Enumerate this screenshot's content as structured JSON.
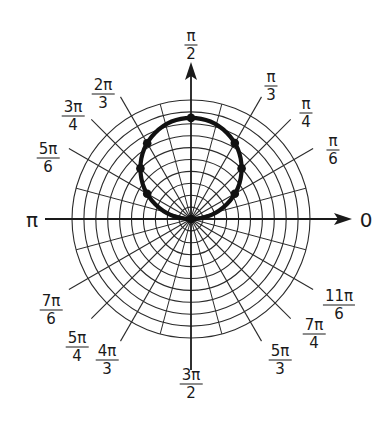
{
  "chart_data": {
    "type": "polar",
    "title": "",
    "curve": {
      "description": "circle r = a·sin(θ), passing through the pole, tangent to polar axis",
      "equation": "r = a sin θ",
      "a_grid_units": 8.5,
      "color": "#111111",
      "points": [
        {
          "theta": "0",
          "theta_rad": 0,
          "r": 0
        },
        {
          "theta": "π/6",
          "theta_rad": 0.5236,
          "r": 4.25
        },
        {
          "theta": "π/4",
          "theta_rad": 0.7854,
          "r": 6.01
        },
        {
          "theta": "π/3",
          "theta_rad": 1.0472,
          "r": 7.36
        },
        {
          "theta": "π/2",
          "theta_rad": 1.5708,
          "r": 8.5
        },
        {
          "theta": "2π/3",
          "theta_rad": 2.0944,
          "r": 7.36
        },
        {
          "theta": "3π/4",
          "theta_rad": 2.3562,
          "r": 6.01
        },
        {
          "theta": "5π/6",
          "theta_rad": 2.618,
          "r": 4.25
        },
        {
          "theta": "π",
          "theta_rad": 3.1416,
          "r": 0
        }
      ]
    },
    "grid": {
      "concentric_circles": 10,
      "radial_spokes_deg": [
        0,
        30,
        45,
        60,
        90,
        120,
        135,
        150,
        180,
        210,
        225,
        240,
        270,
        300,
        315,
        330
      ],
      "grid_on": true
    },
    "axes": {
      "horizontal_arrow_label": "0",
      "horizontal_left_label": "π",
      "vertical_arrow_label": "π/2"
    },
    "angle_labels": [
      {
        "id": "0",
        "num": "0",
        "den": ""
      },
      {
        "id": "pi6",
        "num": "π",
        "den": "6"
      },
      {
        "id": "pi4",
        "num": "π",
        "den": "4"
      },
      {
        "id": "pi3",
        "num": "π",
        "den": "3"
      },
      {
        "id": "pi2",
        "num": "π",
        "den": "2"
      },
      {
        "id": "2pi3",
        "num": "2π",
        "den": "3"
      },
      {
        "id": "3pi4",
        "num": "3π",
        "den": "4"
      },
      {
        "id": "5pi6",
        "num": "5π",
        "den": "6"
      },
      {
        "id": "pi",
        "num": "π",
        "den": ""
      },
      {
        "id": "7pi6",
        "num": "7π",
        "den": "6"
      },
      {
        "id": "5pi4",
        "num": "5π",
        "den": "4"
      },
      {
        "id": "4pi3",
        "num": "4π",
        "den": "3"
      },
      {
        "id": "3pi2",
        "num": "3π",
        "den": "2"
      },
      {
        "id": "5pi3",
        "num": "5π",
        "den": "3"
      },
      {
        "id": "7pi4",
        "num": "7π",
        "den": "4"
      },
      {
        "id": "11pi6",
        "num": "11π",
        "den": "6"
      }
    ]
  },
  "labels": {
    "zero": "0",
    "pi": "π",
    "pi2": {
      "num": "π",
      "den": "2"
    },
    "pi3": {
      "num": "π",
      "den": "3"
    },
    "pi4": {
      "num": "π",
      "den": "4"
    },
    "pi6": {
      "num": "π",
      "den": "6"
    },
    "2pi3": {
      "num": "2π",
      "den": "3"
    },
    "3pi4": {
      "num": "3π",
      "den": "4"
    },
    "5pi6": {
      "num": "5π",
      "den": "6"
    },
    "7pi6": {
      "num": "7π",
      "den": "6"
    },
    "5pi4": {
      "num": "5π",
      "den": "4"
    },
    "4pi3": {
      "num": "4π",
      "den": "3"
    },
    "3pi2": {
      "num": "3π",
      "den": "2"
    },
    "5pi3": {
      "num": "5π",
      "den": "3"
    },
    "7pi4": {
      "num": "7π",
      "den": "4"
    },
    "11pi6": {
      "num": "11π",
      "den": "6"
    }
  },
  "style": {
    "grid_color": "#2b2b2b",
    "curve_color": "#111111",
    "background": "#ffffff"
  }
}
